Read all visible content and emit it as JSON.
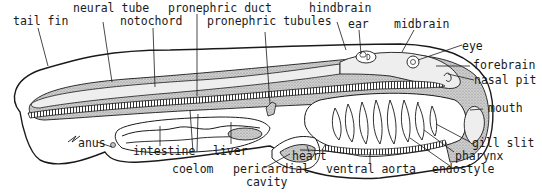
{
  "diagram": {
    "colors": {
      "ink": "#1a1a1a",
      "stipple": "#bdbdbd",
      "light_fill": "#e6e6e6",
      "background": "#ffffff"
    },
    "labels": {
      "tail_fin": "tail fin",
      "neural_tube": "neural tube",
      "notochord": "notochord",
      "pronephric_duct": "pronephric duct",
      "pronephric_tubules": "pronephric tubules",
      "hindbrain": "hindbrain",
      "ear": "ear",
      "midbrain": "midbrain",
      "eye": "eye",
      "forebrain": "forebrain",
      "nasal_pit": "nasal pit",
      "mouth": "mouth",
      "gill_slit": "gill slit",
      "pharynx": "pharynx",
      "endostyle": "endostyle",
      "ventral_aorta": "ventral aorta",
      "heart": "heart",
      "pericardial_cavity_1": "pericardial",
      "pericardial_cavity_2": "cavity",
      "liver": "liver",
      "coelom": "coelom",
      "intestine": "intestine",
      "anus": "anus"
    }
  }
}
